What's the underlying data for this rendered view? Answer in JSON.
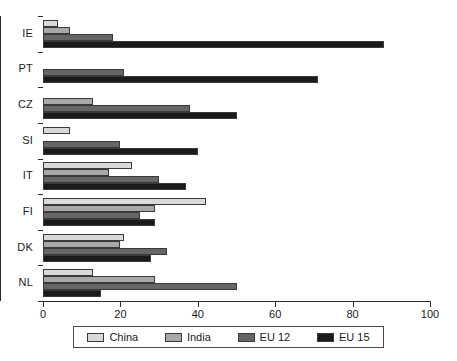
{
  "chart_data": {
    "type": "bar",
    "orientation": "horizontal",
    "title": "",
    "xlabel": "",
    "ylabel": "",
    "xlim": [
      0,
      100
    ],
    "xticks": [
      0,
      20,
      40,
      60,
      80,
      100
    ],
    "grid": false,
    "legend_position": "bottom",
    "categories": [
      "IE",
      "PT",
      "CZ",
      "SI",
      "IT",
      "FI",
      "DK",
      "NL"
    ],
    "series": [
      {
        "name": "China",
        "color": "#d9d9d9",
        "values": [
          4,
          0,
          0,
          7,
          23,
          42,
          21,
          13
        ]
      },
      {
        "name": "India",
        "color": "#a8a8a8",
        "values": [
          7,
          0,
          13,
          0,
          17,
          29,
          20,
          29
        ]
      },
      {
        "name": "EU 12",
        "color": "#666666",
        "values": [
          18,
          21,
          38,
          20,
          30,
          25,
          32,
          50
        ]
      },
      {
        "name": "EU 15",
        "color": "#1a1a1a",
        "values": [
          88,
          71,
          50,
          40,
          37,
          29,
          28,
          15
        ]
      }
    ]
  },
  "axis": {
    "x_tick_labels": [
      "0",
      "20",
      "40",
      "60",
      "80",
      "100"
    ],
    "y_tick_labels": [
      "IE",
      "PT",
      "CZ",
      "SI",
      "IT",
      "FI",
      "DK",
      "NL"
    ]
  },
  "legend": {
    "items": [
      {
        "label": "China",
        "key": "china"
      },
      {
        "label": "India",
        "key": "india"
      },
      {
        "label": "EU 12",
        "key": "eu12"
      },
      {
        "label": "EU 15",
        "key": "eu15"
      }
    ]
  },
  "colors": {
    "china": "#d9d9d9",
    "india": "#a8a8a8",
    "eu12": "#666666",
    "eu15": "#1a1a1a",
    "axis": "#2b2b2b"
  }
}
